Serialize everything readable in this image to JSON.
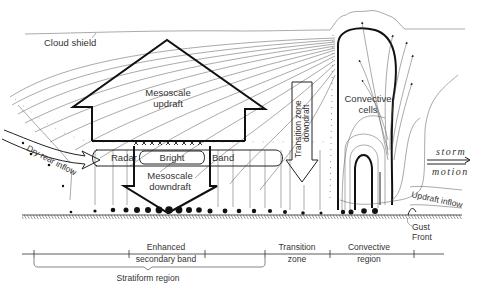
{
  "labels": {
    "cloud_shield": "Cloud shield",
    "mesoscale_updraft_1": "Mesoscale",
    "mesoscale_updraft_2": "updraft",
    "dry_rear_inflow": "Dry rear inflow",
    "radar": "Radar",
    "bright": "Bright",
    "band": "Band",
    "mesoscale_downdraft_1": "Mesoscale",
    "mesoscale_downdraft_2": "downdraft",
    "transition_zone_downdraft_1": "Transition zone",
    "transition_zone_downdraft_2": "downdraft",
    "convective_cells_1": "Convective",
    "convective_cells_2": "cells",
    "storm_motion_1": "storm",
    "storm_motion_2": "motion",
    "updraft_inflow": "Updraft inflow",
    "gust_front_1": "Gust",
    "gust_front_2": "Front"
  },
  "scale": {
    "segments": [
      {
        "line1": "Enhanced",
        "line2": "secondary band"
      },
      {
        "line1": "Transition",
        "line2": "zone"
      },
      {
        "line1": "Convective",
        "line2": "region"
      }
    ],
    "brace_label": "Stratiform region"
  },
  "colors": {
    "line": "#111111",
    "thin_line": "#555555",
    "background": "#ffffff"
  }
}
